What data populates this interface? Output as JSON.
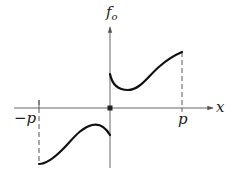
{
  "diagram": {
    "type": "odd-function-extension",
    "labels": {
      "y_axis": "f",
      "y_axis_subscript": "o",
      "x_axis": "x",
      "left_bound": "−p",
      "right_bound": "p"
    },
    "colors": {
      "curve": "#111111",
      "axis": "#555555",
      "dashed": "#444444",
      "background": "#ffffff"
    },
    "elements": [
      "horizontal x-axis with arrow",
      "vertical f_o axis with arrow",
      "origin marker (filled square)",
      "curve on (0, p): starts above axis, dips, rises to endpoint",
      "curve on (−p, 0): mirror image (odd reflection) below axis",
      "dashed vertical line at x = p",
      "dashed vertical line at x = −p"
    ]
  }
}
